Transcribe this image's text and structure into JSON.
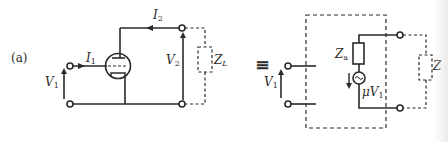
{
  "figure": {
    "panel_label": "(a)",
    "equivalence_symbol": "≡",
    "colors": {
      "ink": "#2a2a2a",
      "background": "#ffffff"
    }
  },
  "left_circuit": {
    "title": "Triode amplifier with load",
    "input_current": {
      "symbol": "I",
      "subscript": "1"
    },
    "input_voltage": {
      "symbol": "V",
      "subscript": "1"
    },
    "output_current": {
      "symbol": "I",
      "subscript": "2"
    },
    "output_voltage": {
      "symbol": "V",
      "subscript": "2"
    },
    "load": {
      "symbol": "Z",
      "subscript": "L"
    },
    "device": "triode-tube"
  },
  "right_circuit": {
    "title": "Equivalent circuit",
    "input_voltage": {
      "symbol": "V",
      "subscript": "1"
    },
    "internal_impedance": {
      "symbol": "Z",
      "subscript": "a"
    },
    "source": {
      "prefix": "μ",
      "symbol": "V",
      "subscript": "1"
    },
    "load": {
      "symbol": "Z",
      "subscript": ""
    }
  }
}
